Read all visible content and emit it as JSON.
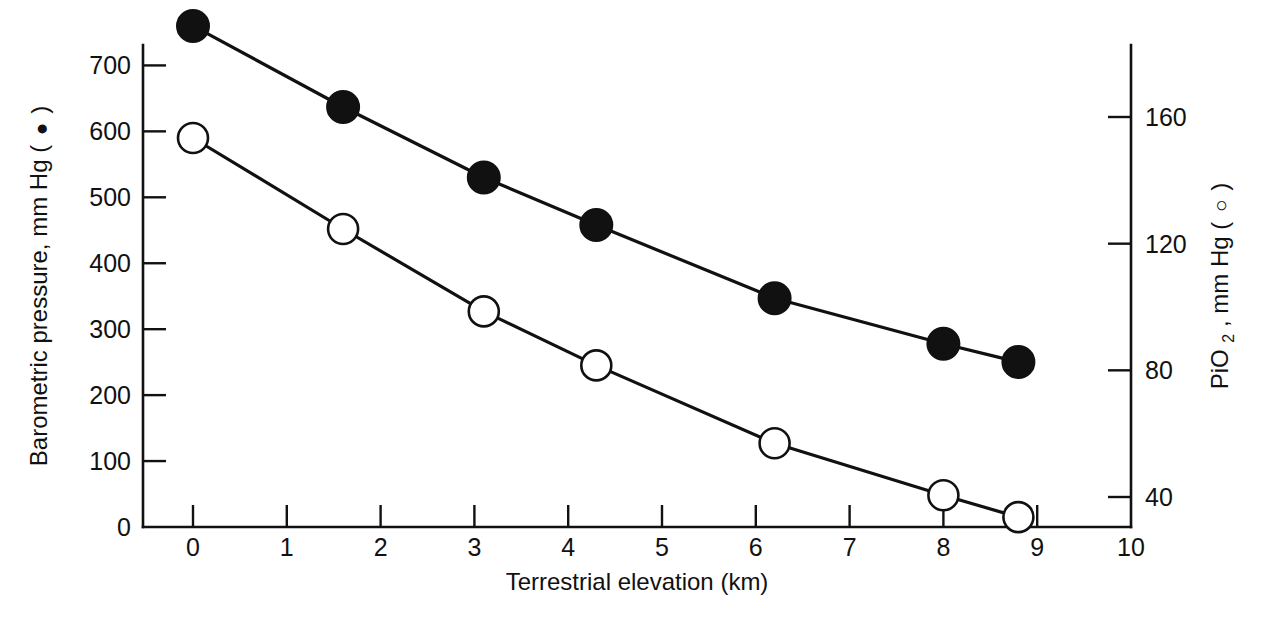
{
  "chart_data": {
    "type": "line",
    "title": "",
    "subtitle": "",
    "xlabel": "Terrestrial elevation (km)",
    "ylabel": "Barometric pressure, mm Hg ( ● )",
    "y2label": "PiO₂, mm Hg ( ○ )",
    "xlim": [
      0,
      10
    ],
    "ylim": [
      0,
      780
    ],
    "y2lim": [
      40,
      175
    ],
    "grid": false,
    "legend": "inline-in-axis-labels",
    "xticks": [
      0,
      1,
      2,
      3,
      4,
      5,
      6,
      7,
      8,
      9,
      10
    ],
    "xticklabels": [
      "0",
      "1",
      "2",
      "3",
      "4",
      "5",
      "6",
      "7",
      "8",
      "9",
      "10"
    ],
    "yticks": [
      0,
      100,
      200,
      300,
      400,
      500,
      600,
      700
    ],
    "yticklabels": [
      "0",
      "100",
      "200",
      "300",
      "400",
      "500",
      "600",
      "700"
    ],
    "y2ticks": [
      40,
      80,
      120,
      160
    ],
    "y2ticklabels": [
      "40",
      "80",
      "120",
      "160"
    ],
    "series": [
      {
        "name": "Barometric pressure",
        "marker": "filled-circle",
        "axis": "left",
        "units": "mm Hg",
        "x": [
          0.0,
          1.6,
          3.1,
          4.3,
          6.2,
          8.0,
          8.8
        ],
        "values": [
          760,
          637,
          530,
          458,
          347,
          278,
          250
        ]
      },
      {
        "name": "PiO2",
        "marker": "open-circle",
        "axis": "right",
        "units": "mm Hg",
        "x": [
          0.0,
          1.6,
          3.1,
          4.3,
          6.2,
          8.0,
          8.8
        ],
        "values": [
          149,
          120,
          102,
          90,
          64,
          48,
          42
        ],
        "values_left_axis_equivalent": [
          590,
          452,
          327,
          245,
          127,
          48,
          15
        ]
      }
    ],
    "annotations": []
  },
  "labels": {
    "x_axis_title": "Terrestrial elevation (km)",
    "y_left_axis_title": "Barometric pressure, mm Hg (",
    "y_left_axis_title_tail": ")",
    "y_right_axis_title": "PiO",
    "y_right_axis_subscript": "2",
    "y_right_axis_title_tail": ", mm Hg (",
    "y_right_axis_title_end": ")"
  },
  "colors": {
    "foreground": "#111111",
    "background": "#ffffff",
    "filled_marker": "#111111",
    "open_marker_fill": "#ffffff"
  }
}
